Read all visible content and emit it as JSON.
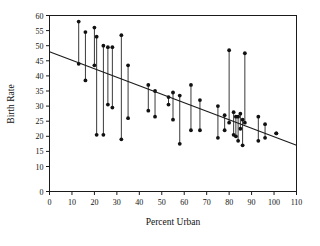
{
  "chart_data": {
    "type": "scatter",
    "title": "",
    "xlabel": "Percent Urban",
    "ylabel": "Birth Rate",
    "xlim": [
      0,
      110
    ],
    "ylim": [
      0,
      60
    ],
    "grid": false,
    "legend": null,
    "xticks": [
      0,
      10,
      20,
      30,
      40,
      50,
      60,
      70,
      80,
      90,
      100,
      110
    ],
    "xtick_labels": [
      "0",
      "10",
      "20",
      "30",
      "40",
      "50",
      "60",
      "70",
      "80",
      "90",
      "100",
      "110"
    ],
    "yticks": [
      0,
      10,
      15,
      20,
      25,
      30,
      35,
      40,
      45,
      50,
      55,
      60
    ],
    "ytick_labels": [
      "0",
      "10",
      "15",
      "20",
      "25",
      "30",
      "35",
      "40",
      "45",
      "50",
      "55",
      "60"
    ],
    "fit_line": {
      "label": "regression line",
      "x0": 0,
      "y0": 48.0,
      "x1": 110,
      "y1": 17.0
    },
    "pairs": [
      {
        "x": 13,
        "y_high": 58.0,
        "y_low": 44.0
      },
      {
        "x": 16,
        "y_high": 54.5,
        "y_low": 38.5
      },
      {
        "x": 20,
        "y_high": 56.0,
        "y_low": 43.5
      },
      {
        "x": 21,
        "y_high": 53.0,
        "y_low": 20.5
      },
      {
        "x": 24,
        "y_high": 50.0,
        "y_low": 20.5
      },
      {
        "x": 26,
        "y_high": 49.5,
        "y_low": 30.5
      },
      {
        "x": 28,
        "y_high": 49.5,
        "y_low": 29.5
      },
      {
        "x": 32,
        "y_high": 53.5,
        "y_low": 19.0
      },
      {
        "x": 35,
        "y_high": 43.5,
        "y_low": 26.0
      },
      {
        "x": 44,
        "y_high": 37.0,
        "y_low": 28.5
      },
      {
        "x": 47,
        "y_high": 35.0,
        "y_low": 26.5
      },
      {
        "x": 53,
        "y_high": 33.0,
        "y_low": 30.5
      },
      {
        "x": 55,
        "y_high": 34.5,
        "y_low": 25.5
      },
      {
        "x": 58,
        "y_high": 33.5,
        "y_low": 17.5
      },
      {
        "x": 63,
        "y_high": 37.0,
        "y_low": 22.0
      },
      {
        "x": 67,
        "y_high": 32.0,
        "y_low": 22.0
      },
      {
        "x": 75,
        "y_high": 30.0,
        "y_low": 19.5
      },
      {
        "x": 78,
        "y_high": 27.0,
        "y_low": 22.0
      },
      {
        "x": 80,
        "y_high": 48.5,
        "y_low": 24.5
      },
      {
        "x": 82,
        "y_high": 28.0,
        "y_low": 20.5
      },
      {
        "x": 83,
        "y_high": 26.5,
        "y_low": 20.0
      },
      {
        "x": 84,
        "y_high": 26.5,
        "y_low": 18.5
      },
      {
        "x": 85,
        "y_high": 27.5,
        "y_low": 22.5
      },
      {
        "x": 86,
        "y_high": 25.5,
        "y_low": 17.0
      },
      {
        "x": 87,
        "y_high": 47.5,
        "y_low": 24.5
      },
      {
        "x": 93,
        "y_high": 26.5,
        "y_low": 18.5
      },
      {
        "x": 96,
        "y_high": 24.0,
        "y_low": 19.5
      },
      {
        "x": 101,
        "y_high": 21.0,
        "y_low": 21.0
      }
    ]
  }
}
